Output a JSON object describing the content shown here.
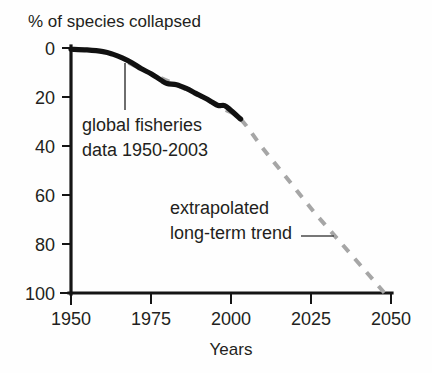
{
  "chart_data": {
    "type": "line",
    "title": "% of species collapsed",
    "xlabel": "Years",
    "ylabel": "",
    "xlim": [
      1950,
      2050
    ],
    "ylim": [
      0,
      100
    ],
    "y_axis_inverted": true,
    "grid": false,
    "legend": "none",
    "xticks": [
      "1950",
      "1975",
      "2000",
      "2025",
      "2050"
    ],
    "xtick_values": [
      1950,
      1975,
      2000,
      2025,
      2050
    ],
    "yticks": [
      "0",
      "20",
      "40",
      "60",
      "80",
      "100"
    ],
    "ytick_values": [
      0,
      20,
      40,
      60,
      80,
      100
    ],
    "series": [
      {
        "name": "global fisheries data 1950-2003",
        "style": "solid-black-thick",
        "color": "#111111",
        "x": [
          1950,
          1955,
          1960,
          1963,
          1966,
          1969,
          1972,
          1975,
          1978,
          1980,
          1983,
          1986,
          1989,
          1992,
          1994,
          1996,
          1998,
          2000,
          2003
        ],
        "values": [
          0.5,
          0.8,
          1.5,
          2.5,
          4.0,
          6.0,
          8.5,
          10.5,
          13.0,
          14.5,
          15.0,
          16.5,
          18.5,
          20.5,
          22.0,
          23.5,
          23.5,
          25.5,
          29.0
        ]
      },
      {
        "name": "extrapolated long-term trend",
        "style": "dashed-gray",
        "color": "#a6a6a6",
        "x": [
          1968,
          1975,
          1982,
          1990,
          1998,
          2003,
          2010,
          2018,
          2026,
          2034,
          2042,
          2048
        ],
        "values": [
          6.0,
          10.5,
          14.5,
          19.5,
          25.0,
          29.0,
          41.0,
          54.0,
          67.0,
          79.0,
          91.0,
          100.0
        ]
      }
    ],
    "annotations": [
      {
        "id": "data-annotation",
        "line1": "global fisheries",
        "line2": "data 1950-2003",
        "leader": "vertical"
      },
      {
        "id": "trend-annotation",
        "line1": "extrapolated",
        "line2": "long-term trend",
        "leader": "horizontal"
      }
    ]
  },
  "colors": {
    "background": "#fefefe",
    "axis": "#151515",
    "data_line": "#111111",
    "trend_line": "#a6a6a6",
    "text": "#231f20"
  }
}
